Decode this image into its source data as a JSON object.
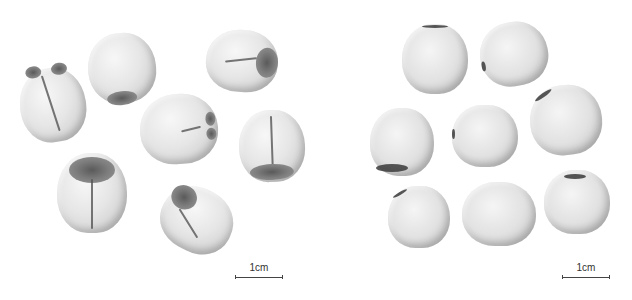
{
  "figure": {
    "left_panel": {
      "description": "Seeds with husk/testa showing grooves and dark hilum",
      "seed_count": 7,
      "scale_bar": {
        "label": "1cm"
      }
    },
    "right_panel": {
      "description": "Polished/hulled smooth seeds",
      "seed_count": 8,
      "scale_bar": {
        "label": "1cm"
      }
    }
  }
}
